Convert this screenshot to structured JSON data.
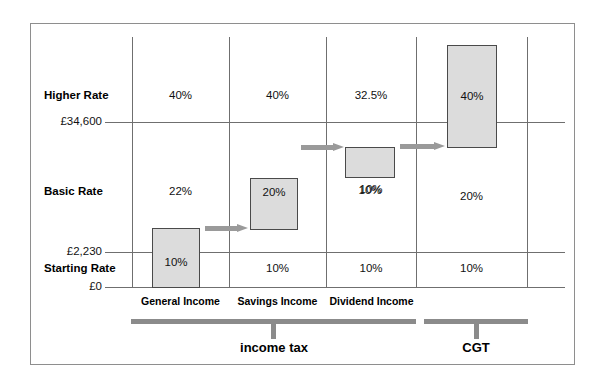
{
  "diagram": {
    "colors": {
      "box_fill": "#dcdcdc",
      "box_stroke": "#4a4a4a",
      "grid": "#6f6f6f",
      "frame": "#8e8e8e",
      "arrow": "#9a9a9a",
      "group_bar": "#8b8b8b",
      "text": "#111111"
    },
    "axis": {
      "ticks": [
        {
          "label": "£34,600",
          "y": 122
        },
        {
          "label": "£2,230",
          "y": 252
        },
        {
          "label": "£0",
          "y": 287
        }
      ]
    },
    "bands": [
      {
        "name": "Higher Rate"
      },
      {
        "name": "Basic Rate"
      },
      {
        "name": "Starting Rate"
      }
    ],
    "columns": [
      {
        "caption": "General Income"
      },
      {
        "caption": "Savings Income"
      },
      {
        "caption": "Dividend Income"
      },
      {
        "caption": ""
      }
    ],
    "cells": [
      {
        "col": "General Income",
        "band": "Higher Rate",
        "rate": "40%"
      },
      {
        "col": "General Income",
        "band": "Basic Rate",
        "rate": "22%"
      },
      {
        "col": "General Income",
        "band": "Starting Rate",
        "rate": "10%"
      },
      {
        "col": "Savings Income",
        "band": "Higher Rate",
        "rate": "40%"
      },
      {
        "col": "Savings Income",
        "band": "Basic Rate",
        "rate": "20%"
      },
      {
        "col": "Savings Income",
        "band": "Starting Rate",
        "rate": "10%"
      },
      {
        "col": "Dividend Income",
        "band": "Higher Rate",
        "rate": "32.5%"
      },
      {
        "col": "Dividend Income",
        "band": "Basic Rate",
        "rate": "10%"
      },
      {
        "col": "Dividend Income",
        "band": "Starting Rate",
        "rate": "10%"
      },
      {
        "col": "CGT",
        "band": "Higher Rate",
        "rate": "40%"
      },
      {
        "col": "CGT",
        "band": "Basic Rate",
        "rate": "20%"
      },
      {
        "col": "CGT",
        "band": "Starting Rate",
        "rate": "10%"
      }
    ],
    "highlight_boxes": [
      {
        "col": "General Income",
        "rate": "10%"
      },
      {
        "col": "Savings Income",
        "rate": "20%"
      },
      {
        "col": "Dividend Income",
        "rate": "10%"
      },
      {
        "col": "CGT",
        "rate": "40%"
      }
    ],
    "groups": [
      {
        "label": "income tax"
      },
      {
        "label": "CGT"
      }
    ]
  }
}
